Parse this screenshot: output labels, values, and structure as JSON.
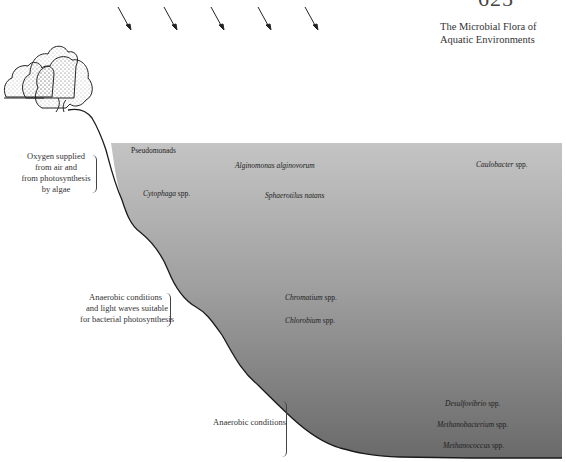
{
  "header": {
    "page_number": "625",
    "running_head_line1": "The Microbial Flora of",
    "running_head_line2": "Aquatic Environments"
  },
  "illustration": {
    "icons": [
      "sunlight-arrow-icon",
      "tree-icon"
    ],
    "sunlight_arrow_count": 5,
    "colors": {
      "water_top": "#c2c2c2",
      "water_bottom": "#6e6e6e",
      "shoreline": "#1a1a1a"
    }
  },
  "zones": [
    {
      "line1": "Oxygen supplied",
      "line2": "from air and",
      "line3": "from photosynthesis",
      "line4": "by algae"
    },
    {
      "line1": "Anaerobic conditions",
      "line2": "and light waves suitable",
      "line3": "for bacterial photosynthesis"
    },
    {
      "line1": "Anaerobic conditions"
    }
  ],
  "organisms": {
    "pseudomonads": {
      "name": "Pseudomonads",
      "suffix": ""
    },
    "alginomonas": {
      "name": "Alginomonas alginovorum",
      "suffix": ""
    },
    "caulobacter": {
      "name": "Caulobacter",
      "suffix": " spp."
    },
    "cytophaga": {
      "name": "Cytophaga",
      "suffix": " spp."
    },
    "sphaerotilus": {
      "name": "Sphaerotilus natans",
      "suffix": ""
    },
    "chromatium": {
      "name": "Chromatium",
      "suffix": " spp."
    },
    "chlorobium": {
      "name": "Chlorobium",
      "suffix": " spp."
    },
    "desulfovibrio": {
      "name": "Desulfovibrio",
      "suffix": " spp."
    },
    "methanobacterium": {
      "name": "Methanobacterium",
      "suffix": " spp."
    },
    "methanococcus": {
      "name": "Methanococcus",
      "suffix": " spp."
    }
  }
}
